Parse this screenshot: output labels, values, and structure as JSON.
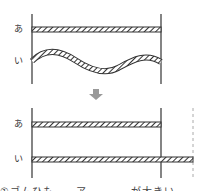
{
  "top_panel": {
    "label_a": "あ",
    "label_b": "い",
    "description": "Two strings between two posts: あ straight, い wavy"
  },
  "arrow": {
    "direction": "down",
    "color": "#999999"
  },
  "bottom_panel": {
    "label_a": "あ",
    "label_b": "い",
    "description": "あ stays same length; い stretched straight extends past right post to dashed line"
  },
  "caption": "①ゴムひも　　ア　　　　が大きい",
  "colors": {
    "line": "#333333",
    "hatch": "#333333",
    "dashed": "#aaaaaa"
  }
}
